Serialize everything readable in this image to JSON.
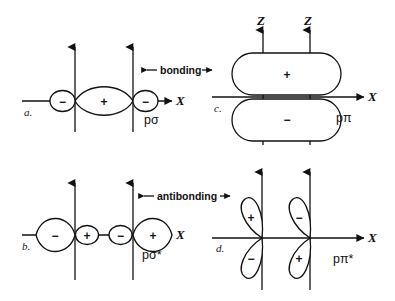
{
  "figure": {
    "background_color": "#ffffff",
    "line_color": "#111111",
    "middle_labels": [
      {
        "id": "bonding",
        "text": "bonding",
        "left_arrow": "←",
        "right_arrow": "→"
      },
      {
        "id": "antibonding",
        "text": "antibonding",
        "left_arrow": "←",
        "right_arrow": "→"
      }
    ],
    "panels": [
      {
        "id": "a",
        "letter": "a.",
        "orbital_label": "pσ",
        "axis_labels": {
          "horizontal": "X",
          "vertical": ""
        },
        "type": "sigma-bonding",
        "lobes": [
          {
            "sign": "−",
            "size": "small",
            "position": "left-outer"
          },
          {
            "sign": "+",
            "size": "large",
            "position": "center"
          },
          {
            "sign": "−",
            "size": "small",
            "position": "right-outer"
          }
        ]
      },
      {
        "id": "b",
        "letter": "b.",
        "orbital_label": "pσ*",
        "axis_labels": {
          "horizontal": "X",
          "vertical": ""
        },
        "type": "sigma-antibonding",
        "lobes": [
          {
            "sign": "−",
            "size": "large",
            "position": "left-outer"
          },
          {
            "sign": "+",
            "size": "small",
            "position": "left-inner"
          },
          {
            "sign": "−",
            "size": "small",
            "position": "right-inner"
          },
          {
            "sign": "+",
            "size": "large",
            "position": "right-outer"
          }
        ]
      },
      {
        "id": "c",
        "letter": "c.",
        "orbital_label": "pπ",
        "axis_labels": {
          "horizontal": "X",
          "vertical_left": "Z",
          "vertical_right": "Z"
        },
        "type": "pi-bonding",
        "lobes": [
          {
            "sign": "+",
            "size": "large",
            "position": "top"
          },
          {
            "sign": "−",
            "size": "large",
            "position": "bottom"
          }
        ]
      },
      {
        "id": "d",
        "letter": "d.",
        "orbital_label": "pπ*",
        "axis_labels": {
          "horizontal": "X",
          "vertical": ""
        },
        "type": "pi-antibonding",
        "lobes": [
          {
            "sign": "+",
            "size": "medium",
            "position": "left-top"
          },
          {
            "sign": "−",
            "size": "medium",
            "position": "left-bottom"
          },
          {
            "sign": "−",
            "size": "medium",
            "position": "right-top"
          },
          {
            "sign": "+",
            "size": "medium",
            "position": "right-bottom"
          }
        ]
      }
    ]
  }
}
